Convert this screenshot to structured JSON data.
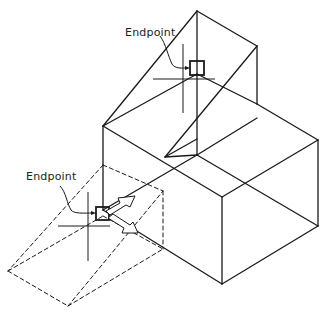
{
  "figure": {
    "labels": [
      {
        "id": "upper",
        "text": "Endpoint"
      },
      {
        "id": "lower",
        "text": "Endpoint"
      }
    ],
    "colors": {
      "line": "#1a1a1a",
      "background": "#ffffff"
    }
  }
}
